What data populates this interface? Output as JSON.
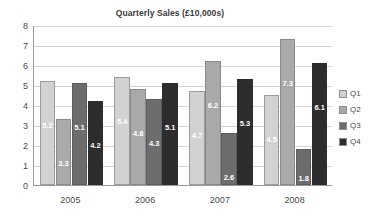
{
  "chart_data": {
    "type": "bar",
    "title": "Quarterly Sales (£10,000s)",
    "xlabel": "",
    "ylabel": "",
    "categories": [
      "2005",
      "2006",
      "2007",
      "2008"
    ],
    "series": [
      {
        "name": "Q1",
        "color": "#d2d2d2",
        "values": [
          5.2,
          5.4,
          4.7,
          4.5
        ]
      },
      {
        "name": "Q2",
        "color": "#a9a9a9",
        "values": [
          3.3,
          4.8,
          6.2,
          7.3
        ]
      },
      {
        "name": "Q3",
        "color": "#6d6d6d",
        "values": [
          5.1,
          4.3,
          2.6,
          1.8
        ]
      },
      {
        "name": "Q4",
        "color": "#2d2d2d",
        "values": [
          4.2,
          5.1,
          5.3,
          6.1
        ]
      }
    ],
    "ylim": [
      0,
      8
    ],
    "yticks": [
      "0",
      "1",
      "2",
      "3",
      "4",
      "5",
      "6",
      "7",
      "8"
    ],
    "grid": true,
    "data_labels": true,
    "legend_position": "right",
    "legend_entries": [
      "Q1",
      "Q2",
      "Q3",
      "Q4"
    ]
  },
  "labels": {
    "b0s0": "5.2",
    "b0s1": "3.3",
    "b0s2": "5.1",
    "b0s3": "4.2",
    "b1s0": "5.4",
    "b1s1": "4.8",
    "b1s2": "4.3",
    "b1s3": "5.1",
    "b2s0": "4.7",
    "b2s1": "6.2",
    "b2s2": "2.6",
    "b2s3": "5.3",
    "b3s0": "4.5",
    "b3s1": "7.3",
    "b3s2": "1.8",
    "b3s3": "6.1"
  }
}
